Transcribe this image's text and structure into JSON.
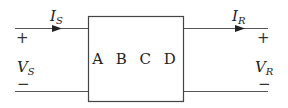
{
  "diagram": {
    "type": "two-port network",
    "block_label": "A B C D",
    "sending": {
      "current": "I",
      "current_sub": "S",
      "voltage": "V",
      "voltage_sub": "S",
      "plus": "+",
      "minus": "−"
    },
    "receiving": {
      "current": "I",
      "current_sub": "R",
      "voltage": "V",
      "voltage_sub": "R",
      "plus": "+",
      "minus": "−"
    },
    "colors": {
      "line": "#444444",
      "text": "#222222"
    }
  }
}
